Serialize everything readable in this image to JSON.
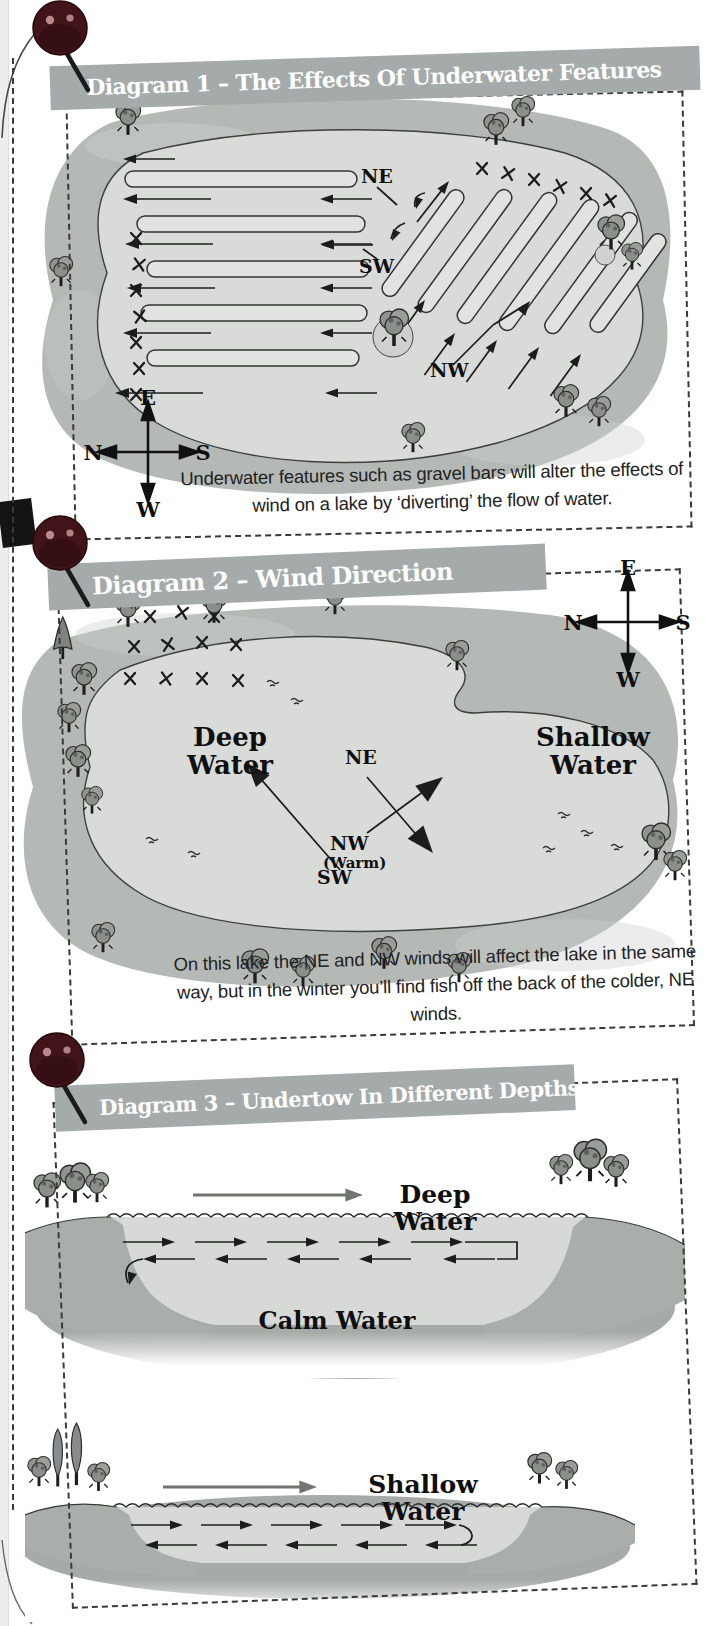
{
  "d1": {
    "title": "Diagram 1 – The Effects Of Underwater Features",
    "caption": "Underwater features such as gravel bars will alter the effects of wind on a lake by ‘diverting’ the flow of water.",
    "labels": {
      "ne": "NE",
      "sw": "SW",
      "nw": "NW"
    },
    "compass": {
      "n": "N",
      "e": "E",
      "s": "S",
      "w": "W"
    }
  },
  "d2": {
    "title": "Diagram 2 – Wind Direction",
    "caption": "On this lake the NE and NW winds will affect the lake in the same way, but in the winter you’ll find fish off the back of the colder, NE winds.",
    "labels": {
      "deep": "Deep Water",
      "shallow": "Shallow Water",
      "ne": "NE",
      "nw": "NW",
      "warm": "(Warm)",
      "sw": "SW"
    },
    "compass": {
      "n": "N",
      "e": "E",
      "s": "S",
      "w": "W"
    }
  },
  "d3": {
    "title": "Diagram 3 – Undertow In Different Depths",
    "deep_label": "Deep Water",
    "calm_label": "Calm Water",
    "shallow_label": "Shallow Water"
  },
  "colors": {
    "banner": "#a5abaa",
    "grass": "#b5b9b6",
    "lake": "#d8dbd8",
    "ink": "#1c1c1c",
    "pin_ball": "#401419",
    "paper": "#ffffff"
  }
}
